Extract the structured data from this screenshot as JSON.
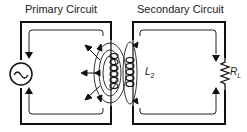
{
  "primary": {
    "title": "Primary Circuit",
    "source_icon": "ac-source-icon"
  },
  "secondary": {
    "title": "Secondary Circuit",
    "inductor_label": "L",
    "inductor_sub": "2",
    "load_label": "R",
    "load_sub": "L"
  },
  "colors": {
    "line": "#111111",
    "flux": "#333333",
    "background": "#ffffff"
  }
}
